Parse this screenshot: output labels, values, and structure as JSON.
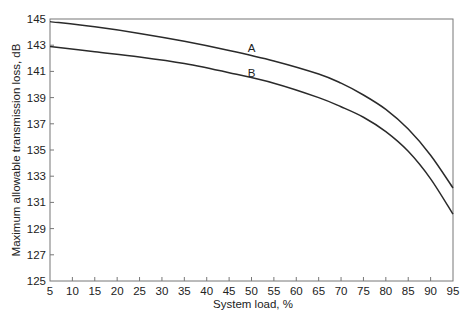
{
  "chart_data": {
    "type": "line",
    "title": "",
    "xlabel": "System load, %",
    "ylabel": "Maximum allowable transmission loss, dB",
    "xlim": [
      5,
      95
    ],
    "ylim": [
      125,
      145
    ],
    "x_ticks": [
      5,
      10,
      15,
      20,
      25,
      30,
      35,
      40,
      45,
      50,
      55,
      60,
      65,
      70,
      75,
      80,
      85,
      90,
      95
    ],
    "y_ticks": [
      125,
      127,
      129,
      131,
      133,
      135,
      137,
      139,
      141,
      143,
      145
    ],
    "grid": false,
    "legend": "none (inline curve labels)",
    "x": [
      5,
      15,
      25,
      35,
      45,
      55,
      65,
      70,
      75,
      80,
      85,
      90,
      95
    ],
    "series": [
      {
        "name": "A",
        "label_position": {
          "x": 50,
          "y": 142.8
        },
        "values": [
          144.8,
          144.4,
          143.9,
          143.3,
          142.6,
          141.8,
          140.8,
          140.1,
          139.2,
          138.1,
          136.6,
          134.6,
          132.1
        ]
      },
      {
        "name": "B",
        "label_position": {
          "x": 50,
          "y": 140.9
        },
        "values": [
          142.9,
          142.5,
          142.1,
          141.6,
          140.9,
          140.1,
          139.0,
          138.3,
          137.5,
          136.4,
          134.9,
          132.8,
          130.1
        ]
      }
    ]
  }
}
